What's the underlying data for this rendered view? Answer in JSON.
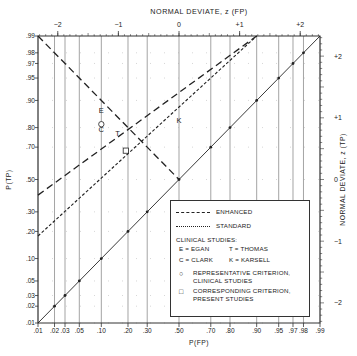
{
  "chart_data": {
    "type": "line",
    "title": "",
    "xlabel": "P(FP)",
    "ylabel": "P(TP)",
    "x_top_label": "NORMAL DEVIATE, z (FP)",
    "y_right_label": "NORMAL DEVIATE, z (TP)",
    "scale": "normal-probability (binormal ROC)",
    "xlim": [
      0.01,
      0.99
    ],
    "ylim": [
      0.01,
      0.99
    ],
    "x_ticks": [
      ".01",
      ".02",
      ".03",
      ".05",
      ".10",
      ".20",
      ".30",
      ".50",
      ".70",
      ".80",
      ".90",
      ".95",
      ".97",
      ".98",
      ".99"
    ],
    "y_ticks": [
      ".01",
      ".02",
      ".03",
      ".05",
      ".10",
      ".20",
      ".30",
      ".50",
      ".70",
      ".80",
      ".90",
      ".95",
      ".97",
      ".98",
      ".99"
    ],
    "x_top_ticks": [
      "-2",
      "-1",
      "0",
      "+1",
      "+2"
    ],
    "y_right_ticks": [
      "+2",
      "+1",
      "0",
      "-1",
      "-2"
    ],
    "grid": true,
    "series": [
      {
        "name": "ENHANCED",
        "style": "long-dash",
        "x": [
          0.01,
          0.9
        ],
        "y": [
          0.4,
          0.99
        ]
      },
      {
        "name": "STANDARD",
        "style": "short-dash",
        "x": [
          0.01,
          0.9
        ],
        "y": [
          0.18,
          0.99
        ]
      },
      {
        "name": "Chance diagonal",
        "style": "solid",
        "x": [
          0.01,
          0.99
        ],
        "y": [
          0.01,
          0.99
        ]
      },
      {
        "name": "Negative diagonal",
        "style": "long-dash",
        "x": [
          0.01,
          0.5
        ],
        "y": [
          0.99,
          0.5
        ]
      }
    ],
    "points": [
      {
        "label": "E",
        "meaning": "EGAN",
        "x": 0.1,
        "y": 0.87
      },
      {
        "label": "C",
        "meaning": "CLARK",
        "x": 0.1,
        "y": 0.79
      },
      {
        "label": "T",
        "meaning": "THOMAS",
        "x": 0.155,
        "y": 0.77
      },
      {
        "label": "K",
        "meaning": "KARSELL",
        "x": 0.5,
        "y": 0.83
      },
      {
        "label": "circle",
        "meaning": "Representative criterion, clinical studies",
        "x": 0.1,
        "y": 0.815
      },
      {
        "label": "square",
        "meaning": "Corresponding criterion, present studies",
        "x": 0.19,
        "y": 0.68
      }
    ],
    "legend_position": "lower-right"
  },
  "legend": {
    "enhanced": "ENHANCED",
    "standard": "STANDARD",
    "clinical_header": "CLINICAL STUDIES:",
    "egan": "E = EGAN",
    "thomas": "T = THOMAS",
    "clark": "C = CLARK",
    "karsell": "K = KARSELL",
    "circle_symbol": "○",
    "circle_line1": "REPRESENTATIVE CRITERION,",
    "circle_line2": "CLINICAL STUDIES",
    "square_symbol": "□",
    "square_line1": "CORRESPONDING CRITERION,",
    "square_line2": "PRESENT STUDIES"
  }
}
